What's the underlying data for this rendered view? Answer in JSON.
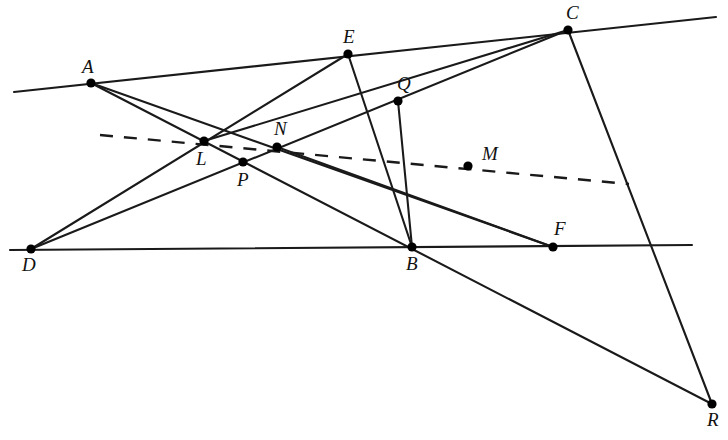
{
  "figure": {
    "width": 728,
    "height": 440,
    "background_color": "#ffffff",
    "stroke_color": "#1a1a1a",
    "point_color": "#000000"
  },
  "points": [
    {
      "name": "A",
      "x": 91,
      "y": 83,
      "label": "A",
      "label_dx": -9,
      "label_dy": -26
    },
    {
      "name": "E",
      "x": 348,
      "y": 54,
      "label": "E",
      "label_dx": -5,
      "label_dy": -27
    },
    {
      "name": "C",
      "x": 568,
      "y": 30,
      "label": "C",
      "label_dx": -2,
      "label_dy": -27
    },
    {
      "name": "Q",
      "x": 398,
      "y": 101,
      "label": "Q",
      "label_dx": -1,
      "label_dy": -27
    },
    {
      "name": "L",
      "x": 204,
      "y": 141,
      "label": "L",
      "label_dx": -8,
      "label_dy": 8
    },
    {
      "name": "N",
      "x": 277,
      "y": 147,
      "label": "N",
      "label_dx": -3,
      "label_dy": -28
    },
    {
      "name": "P",
      "x": 243,
      "y": 162,
      "label": "P",
      "label_dx": -6,
      "label_dy": 8
    },
    {
      "name": "M",
      "x": 468,
      "y": 166,
      "label": "M",
      "label_dx": 14,
      "label_dy": -22
    },
    {
      "name": "D",
      "x": 31,
      "y": 249,
      "label": "D",
      "label_dx": -9,
      "label_dy": 6
    },
    {
      "name": "B",
      "x": 412,
      "y": 247,
      "label": "B",
      "label_dx": -6,
      "label_dy": 7
    },
    {
      "name": "F",
      "x": 553,
      "y": 247,
      "label": "F",
      "label_dx": 1,
      "label_dy": -28
    },
    {
      "name": "R",
      "x": 712,
      "y": 404,
      "label": "R",
      "label_dx": -5,
      "label_dy": 6
    }
  ],
  "solid_lines": [
    {
      "name": "line-AEC-extended",
      "x1": 14,
      "y1": 92,
      "x2": 716,
      "y2": 17
    },
    {
      "name": "line-DBF-extended",
      "x1": 10,
      "y1": 250,
      "x2": 692,
      "y2": 245
    },
    {
      "name": "line-D-through-L-to-E",
      "x1": 31,
      "y1": 249,
      "x2": 348,
      "y2": 54
    },
    {
      "name": "line-D-through-P-to-C",
      "x1": 31,
      "y1": 249,
      "x2": 568,
      "y2": 30
    },
    {
      "name": "line-A-through-L-N-to-F",
      "x1": 91,
      "y1": 83,
      "x2": 553,
      "y2": 247
    },
    {
      "name": "line-A-through-P-to-R",
      "x1": 91,
      "y1": 83,
      "x2": 712,
      "y2": 404
    },
    {
      "name": "line-E-through-Q-M-to-B",
      "x1": 348,
      "y1": 54,
      "x2": 412,
      "y2": 247
    },
    {
      "name": "line-C-through-Q-to-L",
      "x1": 568,
      "y1": 30,
      "x2": 204,
      "y2": 141
    },
    {
      "name": "line-C-through-M-to-R",
      "x1": 568,
      "y1": 30,
      "x2": 712,
      "y2": 404
    },
    {
      "name": "line-N-through-M-to-F",
      "x1": 277,
      "y1": 147,
      "x2": 553,
      "y2": 247
    },
    {
      "name": "line-B-through-M-to-Q",
      "x1": 412,
      "y1": 247,
      "x2": 398,
      "y2": 101
    }
  ],
  "dashed_lines": [
    {
      "name": "dashed-line-LNM",
      "x1": 100,
      "y1": 135,
      "x2": 629,
      "y2": 184
    }
  ],
  "chart_data": {
    "type": "scatter",
    "xlabel": "",
    "ylabel": "",
    "xlim": [
      0,
      728
    ],
    "ylim": [
      440,
      0
    ],
    "grid": false,
    "legend": "none",
    "labels": [
      "A",
      "E",
      "C",
      "Q",
      "L",
      "N",
      "P",
      "M",
      "D",
      "B",
      "F",
      "R"
    ],
    "x": [
      91,
      348,
      568,
      398,
      204,
      277,
      243,
      468,
      31,
      412,
      553,
      712
    ],
    "y": [
      83,
      54,
      30,
      101,
      141,
      147,
      162,
      166,
      249,
      247,
      247,
      404
    ],
    "annotations": [
      "Line A-E-C is a straight line extended at both ends",
      "Line D-B-F is a straight line extended at both ends",
      "Points L, N, M are collinear on the dashed line"
    ]
  }
}
